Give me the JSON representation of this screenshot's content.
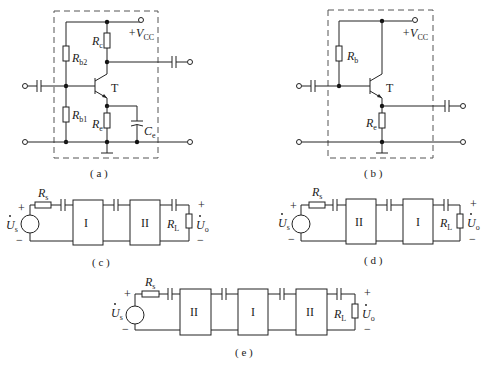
{
  "figure": {
    "panels": [
      {
        "id": "a",
        "caption": "( a )",
        "labels": {
          "rb2": "R",
          "rb2_sub": "b2",
          "rb1": "R",
          "rb1_sub": "b1",
          "rc": "R",
          "rc_sub": "c",
          "re": "R",
          "re_sub": "e",
          "ce": "C",
          "ce_sub": "e",
          "transistor": "T",
          "vcc": "+V",
          "vcc_sub": "CC"
        }
      },
      {
        "id": "b",
        "caption": "( b )",
        "labels": {
          "rb": "R",
          "rb_sub": "b",
          "re": "R",
          "re_sub": "e",
          "transistor": "T",
          "vcc": "+V",
          "vcc_sub": "CC"
        }
      },
      {
        "id": "c",
        "caption": "( c )",
        "blocks": [
          "I",
          "II"
        ],
        "labels": {
          "rs": "R",
          "rs_sub": "s",
          "source": "U",
          "source_sub": "s",
          "rl": "R",
          "rl_sub": "L",
          "out": "U",
          "out_sub": "o",
          "plus": "+",
          "minus": "−"
        }
      },
      {
        "id": "d",
        "caption": "( d )",
        "blocks": [
          "II",
          "I"
        ],
        "labels": {
          "rs": "R",
          "rs_sub": "s",
          "source": "U",
          "source_sub": "s",
          "rl": "R",
          "rl_sub": "L",
          "out": "U",
          "out_sub": "o",
          "plus": "+",
          "minus": "−"
        }
      },
      {
        "id": "e",
        "caption": "( e )",
        "blocks": [
          "II",
          "I",
          "II"
        ],
        "labels": {
          "rs": "R",
          "rs_sub": "s",
          "source": "U",
          "source_sub": "s",
          "rl": "R",
          "rl_sub": "L",
          "out": "U",
          "out_sub": "o",
          "plus": "+",
          "minus": "−"
        }
      }
    ]
  }
}
